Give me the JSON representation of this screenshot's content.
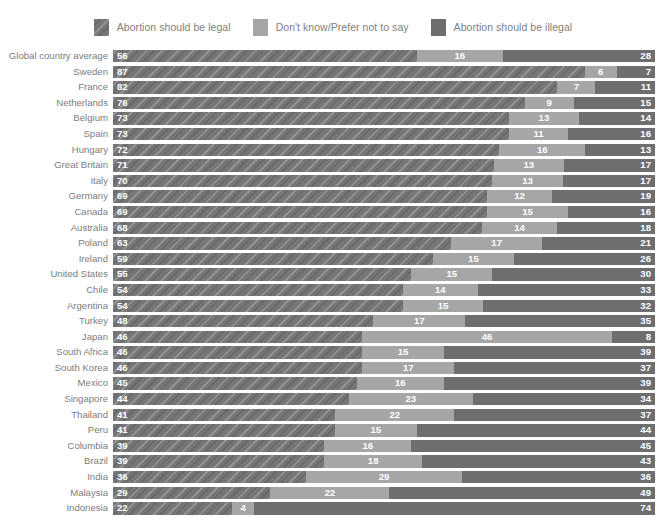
{
  "legend": {
    "items": [
      {
        "label": "Abortion should be legal",
        "color": "#767676",
        "pattern": "diagonal-hatch"
      },
      {
        "label": "Don't know/Prefer not to say",
        "color": "#a6a6a6",
        "pattern": "solid"
      },
      {
        "label": "Abortion should be illegal",
        "color": "#6e6e6e",
        "pattern": "solid"
      }
    ]
  },
  "chart_data": {
    "type": "bar",
    "subtype": "stacked-horizontal-100pct",
    "title": "",
    "xlabel": "",
    "ylabel": "",
    "xlim": [
      0,
      100
    ],
    "grid": false,
    "legend_position": "top-center",
    "orientation": "horizontal",
    "stacked": true,
    "categories": [
      "Global country average",
      "Sweden",
      "France",
      "Netherlands",
      "Belgium",
      "Spain",
      "Hungary",
      "Great Britain",
      "Italy",
      "Germany",
      "Canada",
      "Australia",
      "Poland",
      "Ireland",
      "United States",
      "Chile",
      "Argentina",
      "Turkey",
      "Japan",
      "South Africa",
      "South Korea",
      "Mexico",
      "Singapore",
      "Thailand",
      "Peru",
      "Columbia",
      "Brazil",
      "India",
      "Malaysia",
      "Indonesia"
    ],
    "series": [
      {
        "name": "Abortion should be legal",
        "values": [
          56,
          87,
          82,
          76,
          73,
          73,
          72,
          71,
          70,
          69,
          69,
          68,
          63,
          59,
          55,
          54,
          54,
          48,
          46,
          46,
          46,
          45,
          44,
          41,
          41,
          39,
          39,
          36,
          29,
          22
        ]
      },
      {
        "name": "Don't know/Prefer not to say",
        "values": [
          16,
          6,
          7,
          9,
          13,
          11,
          16,
          13,
          13,
          12,
          15,
          14,
          17,
          15,
          15,
          14,
          15,
          17,
          46,
          15,
          17,
          16,
          23,
          22,
          15,
          16,
          18,
          29,
          22,
          4
        ]
      },
      {
        "name": "Abortion should be illegal",
        "values": [
          28,
          7,
          11,
          15,
          14,
          16,
          13,
          17,
          17,
          19,
          16,
          18,
          21,
          26,
          30,
          33,
          32,
          35,
          8,
          39,
          37,
          39,
          34,
          37,
          44,
          45,
          43,
          36,
          49,
          74
        ]
      }
    ],
    "rows": [
      {
        "label": "Global country average",
        "legal": 56,
        "dk": 16,
        "illegal": 28
      },
      {
        "label": "Sweden",
        "legal": 87,
        "dk": 6,
        "illegal": 7
      },
      {
        "label": "France",
        "legal": 82,
        "dk": 7,
        "illegal": 11
      },
      {
        "label": "Netherlands",
        "legal": 76,
        "dk": 9,
        "illegal": 15
      },
      {
        "label": "Belgium",
        "legal": 73,
        "dk": 13,
        "illegal": 14
      },
      {
        "label": "Spain",
        "legal": 73,
        "dk": 11,
        "illegal": 16
      },
      {
        "label": "Hungary",
        "legal": 72,
        "dk": 16,
        "illegal": 13
      },
      {
        "label": "Great Britain",
        "legal": 71,
        "dk": 13,
        "illegal": 17
      },
      {
        "label": "Italy",
        "legal": 70,
        "dk": 13,
        "illegal": 17
      },
      {
        "label": "Germany",
        "legal": 69,
        "dk": 12,
        "illegal": 19
      },
      {
        "label": "Canada",
        "legal": 69,
        "dk": 15,
        "illegal": 16
      },
      {
        "label": "Australia",
        "legal": 68,
        "dk": 14,
        "illegal": 18
      },
      {
        "label": "Poland",
        "legal": 63,
        "dk": 17,
        "illegal": 21
      },
      {
        "label": "Ireland",
        "legal": 59,
        "dk": 15,
        "illegal": 26
      },
      {
        "label": "United States",
        "legal": 55,
        "dk": 15,
        "illegal": 30
      },
      {
        "label": "Chile",
        "legal": 54,
        "dk": 14,
        "illegal": 33
      },
      {
        "label": "Argentina",
        "legal": 54,
        "dk": 15,
        "illegal": 32
      },
      {
        "label": "Turkey",
        "legal": 48,
        "dk": 17,
        "illegal": 35
      },
      {
        "label": "Japan",
        "legal": 46,
        "dk": 46,
        "illegal": 8
      },
      {
        "label": "South Africa",
        "legal": 46,
        "dk": 15,
        "illegal": 39
      },
      {
        "label": "South Korea",
        "legal": 46,
        "dk": 17,
        "illegal": 37
      },
      {
        "label": "Mexico",
        "legal": 45,
        "dk": 16,
        "illegal": 39
      },
      {
        "label": "Singapore",
        "legal": 44,
        "dk": 23,
        "illegal": 34
      },
      {
        "label": "Thailand",
        "legal": 41,
        "dk": 22,
        "illegal": 37
      },
      {
        "label": "Peru",
        "legal": 41,
        "dk": 15,
        "illegal": 44
      },
      {
        "label": "Columbia",
        "legal": 39,
        "dk": 16,
        "illegal": 45
      },
      {
        "label": "Brazil",
        "legal": 39,
        "dk": 18,
        "illegal": 43
      },
      {
        "label": "India",
        "legal": 36,
        "dk": 29,
        "illegal": 36
      },
      {
        "label": "Malaysia",
        "legal": 29,
        "dk": 22,
        "illegal": 49
      },
      {
        "label": "Indonesia",
        "legal": 22,
        "dk": 4,
        "illegal": 74
      }
    ]
  }
}
